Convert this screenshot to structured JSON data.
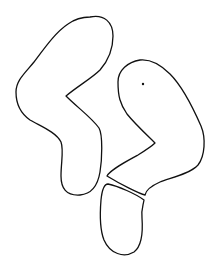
{
  "drawing": {
    "description": "Line drawing of irregular blob shapes",
    "stroke_color": "#111111",
    "background": "#ffffff",
    "shapes": [
      {
        "name": "left-zigzag-shape"
      },
      {
        "name": "right-zigzag-shape"
      },
      {
        "name": "bottom-oval-shape"
      },
      {
        "name": "dot"
      }
    ]
  }
}
